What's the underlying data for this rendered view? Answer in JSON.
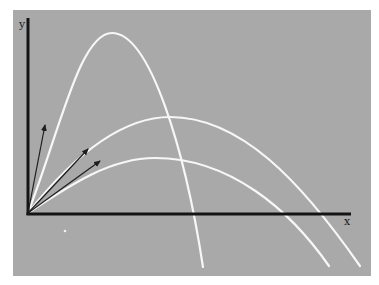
{
  "diagram": {
    "axes": {
      "x_label": "x",
      "y_label": "y"
    },
    "colors": {
      "background": "#ffffff",
      "panel": "#a9a9a9",
      "axis": "#141414",
      "trajectory": "#f7f7f7",
      "vector": "#1e1e1e"
    },
    "trajectories": [
      {
        "name": "steep-trajectory",
        "path": "M28,213 C60,130 80,33 112,33 C150,33 185,150 203,267"
      },
      {
        "name": "medium-trajectory",
        "path": "M28,213 C70,160 120,117 170,117 C240,117 300,180 360,266"
      },
      {
        "name": "shallow-trajectory",
        "path": "M28,213 C70,185 110,158 155,158 C230,158 290,210 329,266"
      }
    ],
    "velocity_vectors": [
      {
        "name": "steep-velocity-arrow",
        "x1": 28,
        "y1": 213,
        "x2": 45,
        "y2": 125
      },
      {
        "name": "medium-velocity-arrow",
        "x1": 28,
        "y1": 213,
        "x2": 88,
        "y2": 149
      },
      {
        "name": "shallow-velocity-arrow",
        "x1": 28,
        "y1": 213,
        "x2": 100,
        "y2": 161
      }
    ]
  }
}
